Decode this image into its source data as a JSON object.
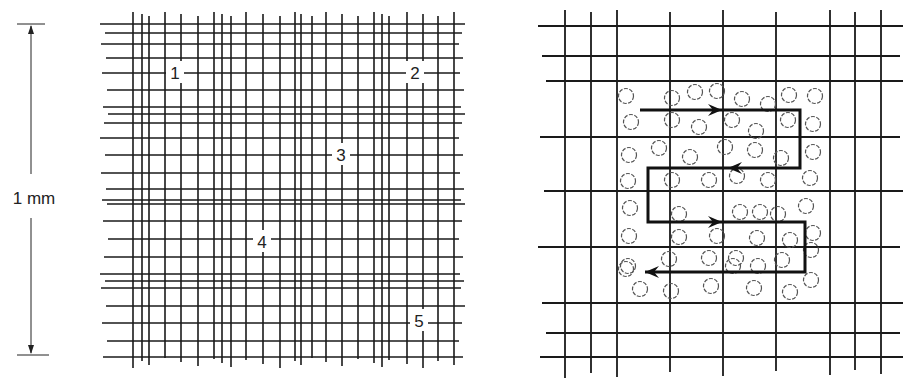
{
  "scale_bar": {
    "label": "1 mm",
    "x": 31,
    "y_top": 24,
    "y_bottom": 355,
    "label_y": 204
  },
  "left_grid": {
    "title": "Hemocytometer counting chamber grid",
    "x_min": 100,
    "x_max": 470,
    "y_min": 12,
    "y_max": 368,
    "vertical_lines": [
      133,
      142,
      149,
      165,
      181,
      198,
      214,
      222,
      231,
      246,
      263,
      280,
      295,
      301,
      312,
      326,
      342,
      358,
      374,
      382,
      389,
      407,
      423,
      438,
      454
    ],
    "horizontal_lines": [
      24,
      33,
      44,
      58,
      73,
      90,
      107,
      114,
      123,
      138,
      155,
      173,
      189,
      200,
      204,
      221,
      239,
      257,
      274,
      281,
      288,
      306,
      323,
      341,
      357
    ],
    "square_labels": [
      {
        "text": "1",
        "x": 175,
        "y": 73
      },
      {
        "text": "2",
        "x": 415,
        "y": 73
      },
      {
        "text": "3",
        "x": 341,
        "y": 155
      },
      {
        "text": "4",
        "x": 262,
        "y": 242
      },
      {
        "text": "5",
        "x": 419,
        "y": 321
      }
    ]
  },
  "right_grid": {
    "title": "Enlarged counting square with cells and counting path",
    "x_min": 538,
    "x_max": 903,
    "y_min": 10,
    "y_max": 378,
    "vertical_lines": [
      565,
      591,
      617,
      670,
      723,
      776,
      830,
      855,
      881
    ],
    "horizontal_lines": [
      26,
      56,
      81,
      137,
      191,
      247,
      303,
      333,
      357
    ],
    "cells": [
      [
        626,
        96
      ],
      [
        672,
        98
      ],
      [
        695,
        92
      ],
      [
        717,
        91
      ],
      [
        742,
        99
      ],
      [
        768,
        104
      ],
      [
        789,
        95
      ],
      [
        815,
        96
      ],
      [
        631,
        122
      ],
      [
        672,
        120
      ],
      [
        699,
        127
      ],
      [
        732,
        120
      ],
      [
        756,
        131
      ],
      [
        788,
        120
      ],
      [
        813,
        124
      ],
      [
        629,
        155
      ],
      [
        659,
        148
      ],
      [
        690,
        157
      ],
      [
        725,
        147
      ],
      [
        755,
        150
      ],
      [
        781,
        158
      ],
      [
        813,
        152
      ],
      [
        628,
        181
      ],
      [
        672,
        180
      ],
      [
        709,
        180
      ],
      [
        737,
        176
      ],
      [
        768,
        180
      ],
      [
        810,
        178
      ],
      [
        630,
        208
      ],
      [
        679,
        214
      ],
      [
        740,
        212
      ],
      [
        760,
        212
      ],
      [
        778,
        214
      ],
      [
        806,
        206
      ],
      [
        629,
        236
      ],
      [
        679,
        237
      ],
      [
        717,
        236
      ],
      [
        757,
        238
      ],
      [
        790,
        240
      ],
      [
        813,
        233
      ],
      [
        628,
        266
      ],
      [
        669,
        259
      ],
      [
        709,
        258
      ],
      [
        733,
        266
      ],
      [
        758,
        266
      ],
      [
        782,
        260
      ],
      [
        811,
        250
      ],
      [
        640,
        289
      ],
      [
        671,
        291
      ],
      [
        711,
        286
      ],
      [
        754,
        288
      ],
      [
        790,
        292
      ],
      [
        811,
        280
      ],
      [
        626,
        269
      ],
      [
        736,
        258
      ]
    ],
    "counting_path": [
      [
        640,
        110
      ],
      [
        800,
        110
      ],
      [
        800,
        168
      ],
      [
        648,
        168
      ],
      [
        648,
        222
      ],
      [
        805,
        222
      ],
      [
        805,
        272
      ],
      [
        645,
        272
      ]
    ],
    "arrows": [
      {
        "x": 722,
        "y": 110,
        "dir": "right"
      },
      {
        "x": 728,
        "y": 168,
        "dir": "left"
      },
      {
        "x": 722,
        "y": 222,
        "dir": "right"
      },
      {
        "x": 645,
        "y": 272,
        "dir": "left"
      }
    ]
  }
}
